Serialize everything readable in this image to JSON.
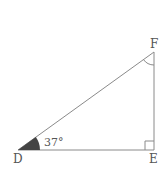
{
  "diagram": {
    "type": "right triangle",
    "vertices": {
      "D": {
        "label": "D"
      },
      "E": {
        "label": "E"
      },
      "F": {
        "label": "F"
      }
    },
    "angle_D": {
      "label": "37°",
      "value_deg": 37
    },
    "right_angle_at": "E",
    "marked_angle_at": "F",
    "colors": {
      "stroke": "#8a8a8a",
      "angle_fill": "#444444",
      "text": "#555555"
    }
  }
}
